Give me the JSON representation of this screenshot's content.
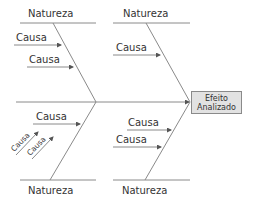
{
  "diagram": {
    "type": "fishbone",
    "effect": {
      "line1": "Efeito",
      "line2": "Analizado"
    },
    "categories": {
      "top_left": "Natureza",
      "top_right": "Natureza",
      "bottom_left": "Natureza",
      "bottom_right": "Natureza"
    },
    "causes": {
      "top_left": [
        "Causa",
        "Causa"
      ],
      "top_right": [
        "Causa"
      ],
      "bottom_left": [
        "Causa"
      ],
      "bottom_left_sub": [
        "Causa",
        "Causa"
      ],
      "bottom_right": [
        "Causa",
        "Causa"
      ]
    },
    "colors": {
      "line": "#8a8a8a",
      "effect_fill": "#e2e2e2",
      "text": "#333333"
    }
  }
}
